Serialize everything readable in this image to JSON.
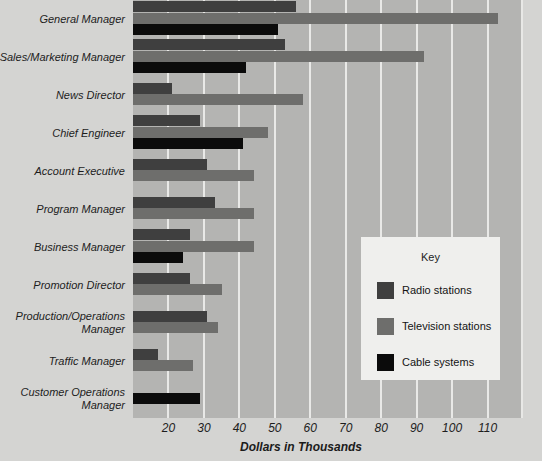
{
  "chart_data": {
    "type": "bar",
    "orientation": "horizontal",
    "title": "",
    "xlabel": "Dollars in Thousands",
    "ylabel": "",
    "xlim": [
      10,
      120
    ],
    "xticks": [
      20,
      30,
      40,
      50,
      60,
      70,
      80,
      90,
      100,
      110
    ],
    "grid": true,
    "legend_title": "Key",
    "legend_position": "inside-right",
    "categories": [
      "General Manager",
      "Sales/Marketing Manager",
      "News Director",
      "Chief Engineer",
      "Account Executive",
      "Program Manager",
      "Business Manager",
      "Promotion Director",
      "Production/Operations Manager",
      "Traffic Manager",
      "Customer Operations Manager"
    ],
    "series": [
      {
        "name": "Radio stations",
        "color": "#3f3f3f",
        "values": [
          56,
          53,
          21,
          29,
          31,
          33,
          26,
          26,
          31,
          17,
          null
        ]
      },
      {
        "name": "Television stations",
        "color": "#6e6e6c",
        "values": [
          113,
          92,
          58,
          48,
          44,
          44,
          44,
          35,
          34,
          27,
          null
        ]
      },
      {
        "name": "Cable systems",
        "color": "#0b0b0b",
        "values": [
          51,
          42,
          null,
          41,
          null,
          null,
          24,
          null,
          null,
          null,
          29
        ]
      }
    ]
  },
  "axis": {
    "tick_labels": [
      "20",
      "30",
      "40",
      "50",
      "60",
      "70",
      "80",
      "90",
      "100",
      "110"
    ],
    "title": "Dollars in Thousands"
  },
  "legend": {
    "title": "Key",
    "entries": [
      {
        "label": "Radio stations",
        "color": "#3f3f3f"
      },
      {
        "label": "Television stations",
        "color": "#6e6e6c"
      },
      {
        "label": "Cable systems",
        "color": "#0b0b0b"
      }
    ]
  },
  "colors": {
    "background": "#d4d4d2",
    "plot_background": "#b4b4b2",
    "gridline": "#e9e9e7",
    "legend_background": "#efefed",
    "text": "#1d1d1d"
  }
}
